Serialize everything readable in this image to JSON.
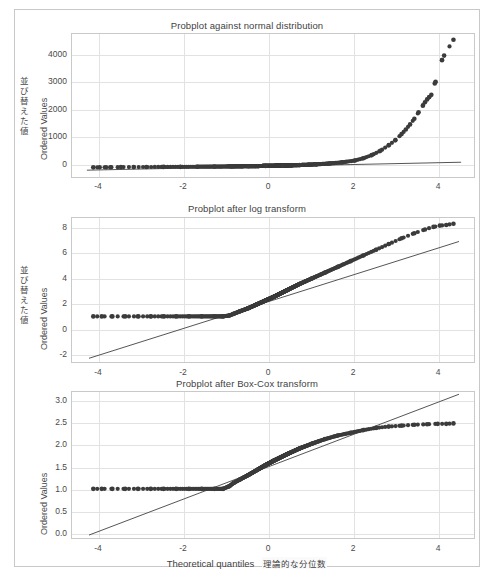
{
  "figure": {
    "background": "#ffffff",
    "frame_color": "#c8c8c8",
    "marker_color": "#3b3b3b",
    "line_color": "#555555",
    "grid_color": "#e2e2e2"
  },
  "panels": [
    {
      "id": "normal",
      "title_en": "Probplot against normal distribution",
      "title_jp": "正規分布に対する確率プロット",
      "ylabel_en": "Ordered Values",
      "ylabel_jp": "並び替えた値",
      "yticks": [
        "0",
        "1000",
        "2000",
        "3000",
        "4000"
      ],
      "xticks": [
        "-4",
        "-2",
        "0",
        "2",
        "4"
      ]
    },
    {
      "id": "log",
      "title_en": "Probplot after log transform",
      "title_jp": "対数変換後の確率プロット",
      "ylabel_en": "Ordered Values",
      "ylabel_jp": "並び替えた値",
      "yticks": [
        "-2",
        "0",
        "2",
        "4",
        "6",
        "8"
      ],
      "xticks": [
        "-4",
        "-2",
        "0",
        "2",
        "4"
      ]
    },
    {
      "id": "boxcox",
      "title_en": "Probplot after Box-Cox transform",
      "title_jp": "Box-Cox変換後の確率プロット",
      "ylabel_en": "Ordered Values",
      "ylabel_jp": "並び替えた値",
      "yticks": [
        "0.0",
        "0.5",
        "1.0",
        "1.5",
        "2.0",
        "2.5",
        "3.0"
      ],
      "xticks": [
        "-4",
        "-2",
        "0",
        "2",
        "4"
      ]
    }
  ],
  "xlabel_en": "Theoretical quantiles",
  "xlabel_jp": "理論的な分位数",
  "chart_data": [
    {
      "type": "scatter",
      "title": "Probplot against normal distribution",
      "subtitle": "正規分布に対する確率プロット",
      "xlabel": "Theoretical quantiles",
      "ylabel": "Ordered Values",
      "xlim": [
        -4.75,
        4.75
      ],
      "ylim": [
        -400,
        4700
      ],
      "xticks": [
        -4,
        -2,
        0,
        2,
        4
      ],
      "yticks": [
        0,
        1000,
        2000,
        3000,
        4000
      ],
      "grid": true,
      "legend": "none",
      "series": [
        {
          "name": "ordered sample quantiles",
          "description": "heavily right-skewed: flat near 0 for theoretical quantiles below about 1.5, then rising sharply",
          "x": [
            -4.25,
            -4.1,
            -3.95,
            -3.85,
            -3.6,
            -3.3,
            -3.0,
            -2.6,
            -2.2,
            -1.8,
            -1.4,
            -1.0,
            -0.6,
            -0.2,
            0.2,
            0.6,
            1.0,
            1.3,
            1.6,
            1.9,
            2.1,
            2.3,
            2.5,
            2.7,
            2.85,
            3.0,
            3.1,
            3.2,
            3.3,
            3.4,
            3.5,
            3.55,
            3.6,
            3.65,
            3.7,
            3.78,
            3.8,
            3.95,
            4.0,
            4.22
          ],
          "y": [
            10,
            12,
            14,
            15,
            18,
            20,
            22,
            25,
            28,
            32,
            36,
            42,
            50,
            60,
            72,
            90,
            115,
            145,
            185,
            250,
            330,
            440,
            590,
            790,
            960,
            1180,
            1340,
            1520,
            1720,
            1950,
            2180,
            2300,
            2400,
            2480,
            2560,
            2960,
            3020,
            3780,
            3940,
            4500
          ]
        }
      ],
      "fit_line": {
        "name": "least-squares fit",
        "x": [
          -4.4,
          4.4
        ],
        "y": [
          -90,
          190
        ]
      }
    },
    {
      "type": "scatter",
      "title": "Probplot after log transform",
      "subtitle": "対数変換後の確率プロット",
      "xlabel": "Theoretical quantiles",
      "ylabel": "Ordered Values",
      "xlim": [
        -4.75,
        4.75
      ],
      "ylim": [
        -2.7,
        8.8
      ],
      "xticks": [
        -4,
        -2,
        0,
        2,
        4
      ],
      "yticks": [
        -2,
        0,
        2,
        4,
        6,
        8
      ],
      "grid": true,
      "legend": "none",
      "series": [
        {
          "name": "ordered sample quantiles (log)",
          "description": "floor at about 1.05 until theoretical quantile near -1.0, then rising roughly linearly to about 8.3",
          "x": [
            -4.25,
            -4.05,
            -3.8,
            -3.5,
            -3.2,
            -2.9,
            -2.6,
            -2.3,
            -2.0,
            -1.7,
            -1.4,
            -1.2,
            -1.05,
            -0.95,
            -0.8,
            -0.6,
            -0.4,
            -0.2,
            0.0,
            0.3,
            0.6,
            0.9,
            1.2,
            1.5,
            1.8,
            2.1,
            2.4,
            2.7,
            3.0,
            3.3,
            3.55,
            3.75,
            3.9,
            4.05,
            4.22
          ],
          "y": [
            1.05,
            1.05,
            1.05,
            1.05,
            1.05,
            1.05,
            1.05,
            1.05,
            1.05,
            1.05,
            1.05,
            1.05,
            1.12,
            1.25,
            1.45,
            1.7,
            2.0,
            2.3,
            2.6,
            3.1,
            3.6,
            4.05,
            4.5,
            4.95,
            5.4,
            5.85,
            6.3,
            6.75,
            7.2,
            7.6,
            7.9,
            8.1,
            8.2,
            8.25,
            8.35
          ]
        }
      ],
      "fit_line": {
        "name": "least-squares fit",
        "x": [
          -4.35,
          4.35
        ],
        "y": [
          -2.25,
          6.95
        ]
      }
    },
    {
      "type": "scatter",
      "title": "Probplot after Box-Cox transform",
      "subtitle": "Box-Cox変換後の確率プロット",
      "xlabel": "Theoretical quantiles",
      "ylabel": "Ordered Values",
      "xlim": [
        -4.75,
        4.75
      ],
      "ylim": [
        -0.25,
        3.05
      ],
      "xticks": [
        -4,
        -2,
        0,
        2,
        4
      ],
      "yticks": [
        0.0,
        0.5,
        1.0,
        1.5,
        2.0,
        2.5,
        3.0
      ],
      "grid": true,
      "legend": "none",
      "series": [
        {
          "name": "ordered sample quantiles (Box-Cox)",
          "description": "floor at about 0.89 until theoretical quantile near -1.05, then rising and saturating near 2.33",
          "x": [
            -4.25,
            -4.05,
            -3.8,
            -3.5,
            -3.2,
            -2.9,
            -2.6,
            -2.3,
            -2.0,
            -1.7,
            -1.4,
            -1.2,
            -1.05,
            -0.95,
            -0.8,
            -0.6,
            -0.4,
            -0.2,
            0.0,
            0.3,
            0.6,
            0.9,
            1.2,
            1.5,
            1.8,
            2.1,
            2.4,
            2.7,
            3.0,
            3.3,
            3.6,
            3.85,
            4.05,
            4.22
          ],
          "y": [
            0.89,
            0.89,
            0.89,
            0.89,
            0.89,
            0.89,
            0.89,
            0.89,
            0.89,
            0.89,
            0.89,
            0.89,
            0.95,
            1.02,
            1.1,
            1.2,
            1.31,
            1.42,
            1.52,
            1.66,
            1.79,
            1.9,
            2.0,
            2.08,
            2.14,
            2.2,
            2.25,
            2.28,
            2.3,
            2.32,
            2.33,
            2.34,
            2.34,
            2.35
          ]
        }
      ],
      "fit_line": {
        "name": "least-squares fit",
        "x": [
          -4.35,
          4.35
        ],
        "y": [
          -0.14,
          3.0
        ]
      }
    }
  ]
}
